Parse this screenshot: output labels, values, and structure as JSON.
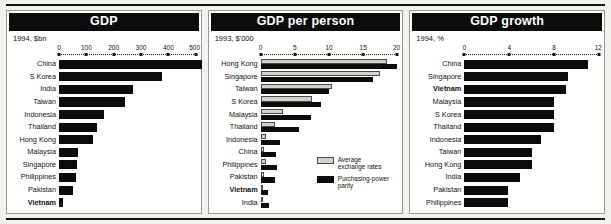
{
  "figure": {
    "panel_count": 3,
    "bar_color": "#0b0b0b",
    "light_bar_color": "#d2d2cd",
    "title_bar_bg": "#0b0b0b",
    "title_bar_fg": "#ffffff"
  },
  "panels": [
    {
      "id": "gdp",
      "title": "GDP",
      "subtitle": "1994, $bn",
      "ticks": [
        "0",
        "100",
        "200",
        "300",
        "400",
        "500"
      ],
      "rows": [
        {
          "label": "China",
          "bold": false,
          "value": 522
        },
        {
          "label": "S Korea",
          "bold": false,
          "value": 378
        },
        {
          "label": "India",
          "bold": false,
          "value": 272
        },
        {
          "label": "Taiwan",
          "bold": false,
          "value": 241
        },
        {
          "label": "Indonesia",
          "bold": false,
          "value": 163
        },
        {
          "label": "Thailand",
          "bold": false,
          "value": 139
        },
        {
          "label": "Hong Kong",
          "bold": false,
          "value": 126
        },
        {
          "label": "Malaysia",
          "bold": false,
          "value": 68
        },
        {
          "label": "Singapore",
          "bold": false,
          "value": 65
        },
        {
          "label": "Philippines",
          "bold": false,
          "value": 62
        },
        {
          "label": "Pakistan",
          "bold": false,
          "value": 50
        },
        {
          "label": "Vietnam",
          "bold": true,
          "value": 13
        }
      ]
    },
    {
      "id": "gdp-per-person",
      "title": "GDP per person",
      "subtitle": "1993, $'000",
      "ticks": [
        "0",
        "5",
        "10",
        "15",
        "20"
      ],
      "legend": [
        {
          "key": "exchange",
          "label": "Average exchange rates",
          "swatch": "light"
        },
        {
          "key": "ppp",
          "label": "Purchasing-power parity",
          "swatch": "dark"
        }
      ],
      "rows": [
        {
          "label": "Hong Kong",
          "bold": false,
          "exchange": 18.5,
          "ppp": 20.0
        },
        {
          "label": "Singapore",
          "bold": false,
          "exchange": 17.5,
          "ppp": 16.5
        },
        {
          "label": "Taiwan",
          "bold": false,
          "exchange": 10.4,
          "ppp": 10.0
        },
        {
          "label": "S Korea",
          "bold": false,
          "exchange": 7.5,
          "ppp": 8.9
        },
        {
          "label": "Malaysia",
          "bold": false,
          "exchange": 3.3,
          "ppp": 7.4
        },
        {
          "label": "Thailand",
          "bold": false,
          "exchange": 2.1,
          "ppp": 5.6
        },
        {
          "label": "Indonesia",
          "bold": false,
          "exchange": 0.75,
          "ppp": 2.8
        },
        {
          "label": "China",
          "bold": false,
          "exchange": 0.45,
          "ppp": 2.3
        },
        {
          "label": "Philippines",
          "bold": false,
          "exchange": 0.82,
          "ppp": 2.4
        },
        {
          "label": "Pakistan",
          "bold": false,
          "exchange": 0.42,
          "ppp": 2.1
        },
        {
          "label": "Vietnam",
          "bold": true,
          "exchange": 0.2,
          "ppp": 1.1
        },
        {
          "label": "India",
          "bold": false,
          "exchange": 0.3,
          "ppp": 1.2
        }
      ]
    },
    {
      "id": "gdp-growth",
      "title": "GDP growth",
      "subtitle": "1994, %",
      "ticks": [
        "0",
        "4",
        "8",
        "12"
      ],
      "rows": [
        {
          "label": "China",
          "bold": false,
          "value": 11.0
        },
        {
          "label": "Singapore",
          "bold": false,
          "value": 9.2
        },
        {
          "label": "Vietnam",
          "bold": true,
          "value": 9.1
        },
        {
          "label": "Malaysia",
          "bold": false,
          "value": 8.0
        },
        {
          "label": "S Korea",
          "bold": false,
          "value": 8.0
        },
        {
          "label": "Thailand",
          "bold": false,
          "value": 8.0
        },
        {
          "label": "Indonesia",
          "bold": false,
          "value": 6.8
        },
        {
          "label": "Taiwan",
          "bold": false,
          "value": 6.0
        },
        {
          "label": "Hong Kong",
          "bold": false,
          "value": 6.0
        },
        {
          "label": "India",
          "bold": false,
          "value": 5.0
        },
        {
          "label": "Pakistan",
          "bold": false,
          "value": 3.9
        },
        {
          "label": "Philippines",
          "bold": false,
          "value": 3.9
        }
      ]
    }
  ],
  "chart_data": [
    {
      "type": "bar",
      "title": "GDP",
      "subtitle": "1994, $bn",
      "xlabel": "",
      "ylabel": "",
      "orientation": "horizontal",
      "xlim": [
        0,
        500
      ],
      "xticks": [
        0,
        100,
        200,
        300,
        400,
        500
      ],
      "grid": false,
      "categories": [
        "China",
        "S Korea",
        "India",
        "Taiwan",
        "Indonesia",
        "Thailand",
        "Hong Kong",
        "Malaysia",
        "Singapore",
        "Philippines",
        "Pakistan",
        "Vietnam"
      ],
      "values": [
        522,
        378,
        272,
        241,
        163,
        139,
        126,
        68,
        65,
        62,
        50,
        13
      ],
      "highlight": [
        "Vietnam"
      ]
    },
    {
      "type": "bar",
      "title": "GDP per person",
      "subtitle": "1993, $'000",
      "xlabel": "",
      "ylabel": "",
      "orientation": "horizontal",
      "xlim": [
        0,
        20
      ],
      "xticks": [
        0,
        5,
        10,
        15,
        20
      ],
      "grid": false,
      "legend_position": "inside-right-middle",
      "categories": [
        "Hong Kong",
        "Singapore",
        "Taiwan",
        "S Korea",
        "Malaysia",
        "Thailand",
        "Indonesia",
        "China",
        "Philippines",
        "Pakistan",
        "Vietnam",
        "India"
      ],
      "series": [
        {
          "name": "Average exchange rates",
          "color": "#d2d2cd",
          "values": [
            18.5,
            17.5,
            10.4,
            7.5,
            3.3,
            2.1,
            0.75,
            0.45,
            0.82,
            0.42,
            0.2,
            0.3
          ]
        },
        {
          "name": "Purchasing-power parity",
          "color": "#0b0b0b",
          "values": [
            20.0,
            16.5,
            10.0,
            8.9,
            7.4,
            5.6,
            2.8,
            2.3,
            2.4,
            2.1,
            1.1,
            1.2
          ]
        }
      ],
      "highlight": [
        "Vietnam"
      ]
    },
    {
      "type": "bar",
      "title": "GDP growth",
      "subtitle": "1994, %",
      "xlabel": "",
      "ylabel": "",
      "orientation": "horizontal",
      "xlim": [
        0,
        12
      ],
      "xticks": [
        0,
        4,
        8,
        12
      ],
      "grid": false,
      "categories": [
        "China",
        "Singapore",
        "Vietnam",
        "Malaysia",
        "S Korea",
        "Thailand",
        "Indonesia",
        "Taiwan",
        "Hong Kong",
        "India",
        "Pakistan",
        "Philippines"
      ],
      "values": [
        11.0,
        9.2,
        9.1,
        8.0,
        8.0,
        8.0,
        6.8,
        6.0,
        6.0,
        5.0,
        3.9,
        3.9
      ],
      "highlight": [
        "Vietnam"
      ]
    }
  ]
}
